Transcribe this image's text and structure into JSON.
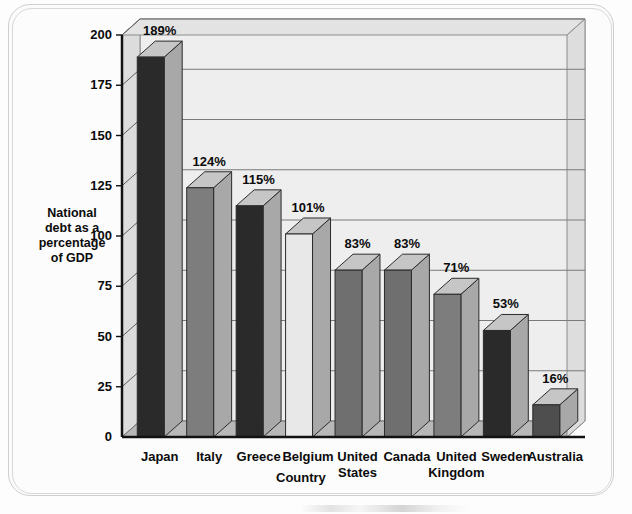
{
  "chart_data": {
    "type": "bar",
    "title": "",
    "subtitle": "",
    "xlabel": "Country",
    "ylabel": "National debt as a percentage of  GDP",
    "ylabel_lines": [
      "National",
      "debt as a",
      "percentage",
      "of  GDP"
    ],
    "categories": [
      "Japan",
      "Italy",
      "Greece",
      "Belgium",
      "United States",
      "Canada",
      "United Kingdom",
      "Sweden",
      "Australia"
    ],
    "category_lines": [
      [
        "Japan"
      ],
      [
        "Italy"
      ],
      [
        "Greece"
      ],
      [
        "Belgium"
      ],
      [
        "United",
        "States"
      ],
      [
        "Canada"
      ],
      [
        "United",
        "Kingdom"
      ],
      [
        "Sweden"
      ],
      [
        "Australia"
      ]
    ],
    "values": [
      189,
      124,
      115,
      101,
      83,
      83,
      71,
      53,
      16
    ],
    "data_labels": [
      "189%",
      "124%",
      "115%",
      "101%",
      "83%",
      "83%",
      "71%",
      "53%",
      "16%"
    ],
    "bar_colors": [
      "#2a2a2a",
      "#7d7d7d",
      "#2a2a2a",
      "#e8e8e8",
      "#6f6f6f",
      "#6f6f6f",
      "#7d7d7d",
      "#2a2a2a",
      "#4e4e4e"
    ],
    "ylim": [
      0,
      200
    ],
    "yticks": [
      0,
      25,
      50,
      75,
      100,
      125,
      150,
      175,
      200
    ],
    "ytick_labels": [
      "0",
      "25",
      "50",
      "75",
      "100",
      "125",
      "150",
      "175",
      "200"
    ],
    "grid": true,
    "grid_axis": "y",
    "legend": false,
    "legend_position": "none",
    "style": "3d-perspective-column",
    "plot_background": "#eeeeee",
    "wall_color": "#dcdcdc",
    "floor_color": "#b8b8b8",
    "axis_color": "#111111",
    "grid_color": "#7a7a7a"
  },
  "frame": {
    "outer_border_color": "#cfcfcf",
    "page_background": "#fdfdfd"
  }
}
